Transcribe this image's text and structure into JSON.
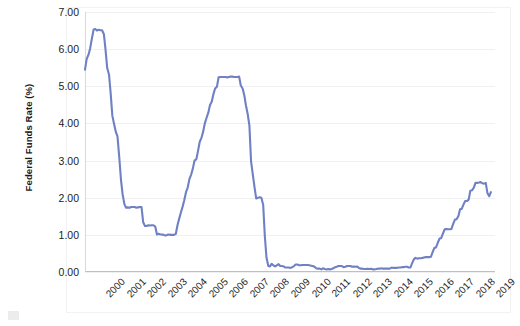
{
  "chart_data": {
    "type": "line",
    "title": "",
    "subtitle": "",
    "xlabel": "",
    "ylabel": "Federal Funds Rate (%)",
    "ylim": [
      0.0,
      7.0
    ],
    "ytick_labels": [
      "0.00",
      "1.00",
      "2.00",
      "3.00",
      "4.00",
      "5.00",
      "6.00",
      "7.00"
    ],
    "ytick_values": [
      0,
      1,
      2,
      3,
      4,
      5,
      6,
      7
    ],
    "xlim": [
      2000,
      2019.95
    ],
    "categories": [
      "2000",
      "2001",
      "2002",
      "2003",
      "2004",
      "2005",
      "2006",
      "2007",
      "2008",
      "2009",
      "2010",
      "2011",
      "2012",
      "2013",
      "2014",
      "2015",
      "2016",
      "2017",
      "2018",
      "2019"
    ],
    "grid": "horizontal",
    "legend": "none",
    "line_color": "#6f81c4",
    "line_width": 2.1,
    "series": [
      {
        "name": "Federal Funds Rate",
        "x": [
          2000.0,
          2000.08,
          2000.17,
          2000.25,
          2000.33,
          2000.42,
          2000.5,
          2000.58,
          2000.67,
          2000.75,
          2000.83,
          2000.92,
          2001.0,
          2001.08,
          2001.17,
          2001.25,
          2001.33,
          2001.42,
          2001.5,
          2001.58,
          2001.67,
          2001.75,
          2001.83,
          2001.92,
          2002.0,
          2002.08,
          2002.17,
          2002.25,
          2002.33,
          2002.42,
          2002.5,
          2002.58,
          2002.67,
          2002.75,
          2002.83,
          2002.92,
          2003.0,
          2003.08,
          2003.17,
          2003.25,
          2003.33,
          2003.42,
          2003.5,
          2003.58,
          2003.67,
          2003.75,
          2003.83,
          2003.92,
          2004.0,
          2004.08,
          2004.17,
          2004.25,
          2004.33,
          2004.42,
          2004.5,
          2004.58,
          2004.67,
          2004.75,
          2004.83,
          2004.92,
          2005.0,
          2005.08,
          2005.17,
          2005.25,
          2005.33,
          2005.42,
          2005.5,
          2005.58,
          2005.67,
          2005.75,
          2005.83,
          2005.92,
          2006.0,
          2006.08,
          2006.17,
          2006.25,
          2006.33,
          2006.42,
          2006.5,
          2006.58,
          2006.67,
          2006.75,
          2006.83,
          2006.92,
          2007.0,
          2007.08,
          2007.17,
          2007.25,
          2007.33,
          2007.42,
          2007.5,
          2007.58,
          2007.67,
          2007.75,
          2007.83,
          2007.92,
          2008.0,
          2008.08,
          2008.17,
          2008.25,
          2008.33,
          2008.42,
          2008.5,
          2008.58,
          2008.67,
          2008.75,
          2008.83,
          2008.92,
          2009.0,
          2009.08,
          2009.17,
          2009.25,
          2009.33,
          2009.42,
          2009.5,
          2009.58,
          2009.67,
          2009.75,
          2009.83,
          2009.92,
          2010.0,
          2010.08,
          2010.17,
          2010.25,
          2010.33,
          2010.42,
          2010.5,
          2010.58,
          2010.67,
          2010.75,
          2010.83,
          2010.92,
          2011.0,
          2011.08,
          2011.17,
          2011.25,
          2011.33,
          2011.42,
          2011.5,
          2011.58,
          2011.67,
          2011.75,
          2011.83,
          2011.92,
          2012.0,
          2012.08,
          2012.17,
          2012.25,
          2012.33,
          2012.42,
          2012.5,
          2012.58,
          2012.67,
          2012.75,
          2012.83,
          2012.92,
          2013.0,
          2013.08,
          2013.17,
          2013.25,
          2013.33,
          2013.42,
          2013.5,
          2013.58,
          2013.67,
          2013.75,
          2013.83,
          2013.92,
          2014.0,
          2014.08,
          2014.17,
          2014.25,
          2014.33,
          2014.42,
          2014.5,
          2014.58,
          2014.67,
          2014.75,
          2014.83,
          2014.92,
          2015.0,
          2015.08,
          2015.17,
          2015.25,
          2015.33,
          2015.42,
          2015.5,
          2015.58,
          2015.67,
          2015.75,
          2015.83,
          2015.92,
          2016.0,
          2016.08,
          2016.17,
          2016.25,
          2016.33,
          2016.42,
          2016.5,
          2016.58,
          2016.67,
          2016.75,
          2016.83,
          2016.92,
          2017.0,
          2017.08,
          2017.17,
          2017.25,
          2017.33,
          2017.42,
          2017.5,
          2017.58,
          2017.67,
          2017.75,
          2017.83,
          2017.92,
          2018.0,
          2018.08,
          2018.17,
          2018.25,
          2018.33,
          2018.42,
          2018.5,
          2018.58,
          2018.67,
          2018.75,
          2018.83,
          2018.92,
          2019.0,
          2019.08,
          2019.17,
          2019.25,
          2019.33,
          2019.42,
          2019.5,
          2019.58,
          2019.67,
          2019.75
        ],
        "values": [
          5.45,
          5.73,
          5.85,
          6.02,
          6.27,
          6.53,
          6.54,
          6.5,
          6.52,
          6.51,
          6.51,
          6.4,
          5.98,
          5.49,
          5.31,
          4.8,
          4.21,
          3.97,
          3.77,
          3.65,
          3.07,
          2.49,
          2.09,
          1.82,
          1.73,
          1.74,
          1.73,
          1.75,
          1.75,
          1.75,
          1.73,
          1.74,
          1.75,
          1.75,
          1.34,
          1.24,
          1.24,
          1.26,
          1.25,
          1.26,
          1.26,
          1.22,
          1.01,
          1.03,
          1.01,
          1.01,
          1.0,
          0.98,
          1.0,
          1.01,
          1.0,
          1.0,
          1.0,
          1.03,
          1.26,
          1.43,
          1.61,
          1.76,
          1.93,
          2.16,
          2.28,
          2.5,
          2.63,
          2.79,
          3.0,
          3.04,
          3.26,
          3.5,
          3.62,
          3.78,
          4.0,
          4.16,
          4.29,
          4.49,
          4.59,
          4.79,
          4.94,
          4.99,
          5.24,
          5.25,
          5.25,
          5.25,
          5.25,
          5.24,
          5.25,
          5.26,
          5.26,
          5.25,
          5.25,
          5.25,
          5.26,
          5.02,
          4.94,
          4.76,
          4.49,
          4.24,
          3.94,
          2.98,
          2.61,
          2.28,
          1.98,
          2.0,
          2.01,
          2.0,
          1.81,
          0.97,
          0.39,
          0.16,
          0.15,
          0.22,
          0.18,
          0.15,
          0.18,
          0.21,
          0.16,
          0.16,
          0.15,
          0.12,
          0.12,
          0.12,
          0.11,
          0.13,
          0.16,
          0.2,
          0.2,
          0.18,
          0.18,
          0.19,
          0.19,
          0.19,
          0.19,
          0.18,
          0.17,
          0.16,
          0.14,
          0.1,
          0.09,
          0.09,
          0.07,
          0.1,
          0.08,
          0.07,
          0.08,
          0.07,
          0.08,
          0.1,
          0.13,
          0.14,
          0.16,
          0.16,
          0.16,
          0.13,
          0.14,
          0.16,
          0.16,
          0.16,
          0.14,
          0.15,
          0.14,
          0.15,
          0.11,
          0.09,
          0.09,
          0.08,
          0.08,
          0.09,
          0.08,
          0.09,
          0.07,
          0.07,
          0.08,
          0.09,
          0.09,
          0.1,
          0.09,
          0.09,
          0.09,
          0.09,
          0.09,
          0.12,
          0.11,
          0.11,
          0.11,
          0.12,
          0.12,
          0.13,
          0.13,
          0.14,
          0.14,
          0.12,
          0.12,
          0.24,
          0.34,
          0.38,
          0.36,
          0.37,
          0.37,
          0.38,
          0.39,
          0.4,
          0.4,
          0.4,
          0.41,
          0.54,
          0.65,
          0.66,
          0.79,
          0.9,
          0.91,
          1.04,
          1.15,
          1.16,
          1.15,
          1.15,
          1.16,
          1.3,
          1.41,
          1.42,
          1.51,
          1.69,
          1.7,
          1.82,
          1.91,
          1.91,
          1.95,
          2.19,
          2.2,
          2.27,
          2.4,
          2.4,
          2.41,
          2.42,
          2.39,
          2.38,
          2.4,
          2.13,
          2.04,
          2.15
        ]
      }
    ]
  }
}
